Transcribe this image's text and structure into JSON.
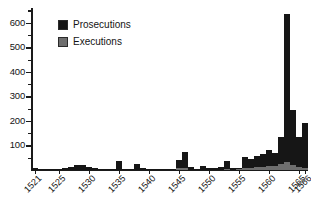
{
  "chart_data": {
    "type": "bar",
    "title": "",
    "subtitle": "",
    "xlabel": "",
    "ylabel": "",
    "grid": false,
    "stacked": true,
    "legend_position": "top-left",
    "ylim": [
      0,
      660
    ],
    "yticks": [
      100,
      200,
      300,
      400,
      500,
      600
    ],
    "ytick_labels": [
      "100",
      "200",
      "300",
      "400",
      "500",
      "600"
    ],
    "y_minor_ticks": [
      50,
      150,
      250,
      350,
      450,
      550,
      650
    ],
    "xlim": [
      1521,
      1566
    ],
    "xtick_labels": [
      "1521",
      "1525",
      "1530",
      "1535",
      "1540",
      "1545",
      "1550",
      "1555",
      "1560",
      "1565",
      "1566"
    ],
    "xticks": [
      1521,
      1525,
      1530,
      1535,
      1540,
      1545,
      1550,
      1555,
      1560,
      1565,
      1566
    ],
    "categories": [
      "1521",
      "1522",
      "1523",
      "1524",
      "1525",
      "1526",
      "1527",
      "1528",
      "1529",
      "1530",
      "1531",
      "1532",
      "1533",
      "1534",
      "1535",
      "1536",
      "1537",
      "1538",
      "1539",
      "1540",
      "1541",
      "1542",
      "1543",
      "1544",
      "1545",
      "1546",
      "1547",
      "1548",
      "1549",
      "1550",
      "1551",
      "1552",
      "1553",
      "1554",
      "1555",
      "1556",
      "1557",
      "1558",
      "1559",
      "1560",
      "1561",
      "1562",
      "1563",
      "1564",
      "1565",
      "1566"
    ],
    "series": [
      {
        "name": "Prosecutions",
        "color": "#161616",
        "values": [
          8,
          6,
          5,
          4,
          6,
          10,
          14,
          20,
          22,
          14,
          8,
          6,
          5,
          4,
          38,
          6,
          5,
          26,
          8,
          5,
          4,
          4,
          5,
          6,
          42,
          72,
          12,
          6,
          18,
          8,
          10,
          14,
          38,
          8,
          10,
          52,
          46,
          56,
          64,
          80,
          70,
          136,
          636,
          246,
          134,
          190
        ]
      },
      {
        "name": "Executions",
        "color": "#6e6e6e",
        "values": [
          0,
          0,
          0,
          0,
          0,
          0,
          0,
          0,
          0,
          0,
          0,
          0,
          0,
          0,
          0,
          0,
          0,
          0,
          0,
          0,
          0,
          0,
          0,
          0,
          8,
          10,
          0,
          0,
          0,
          0,
          0,
          0,
          6,
          0,
          4,
          8,
          10,
          12,
          14,
          18,
          16,
          26,
          34,
          22,
          12,
          10
        ]
      }
    ],
    "legend": [
      {
        "label": "Prosecutions",
        "color": "#161616",
        "swatch": "legend-swatch-prosecutions"
      },
      {
        "label": "Executions",
        "color": "#6e6e6e",
        "swatch": "legend-swatch-executions"
      }
    ],
    "colors": {
      "prosecutions": "#161616",
      "executions": "#6e6e6e",
      "axis": "#1a1a1a",
      "background": "#ffffff",
      "text": "#141414"
    }
  }
}
